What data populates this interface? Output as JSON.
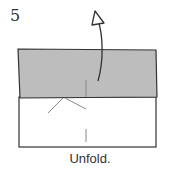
{
  "step": {
    "number": "5",
    "caption": "Unfold."
  },
  "colors": {
    "flap_fill": "#bdbdbd",
    "paper_fill": "#ffffff",
    "outline": "#333333",
    "crease": "#888888"
  }
}
